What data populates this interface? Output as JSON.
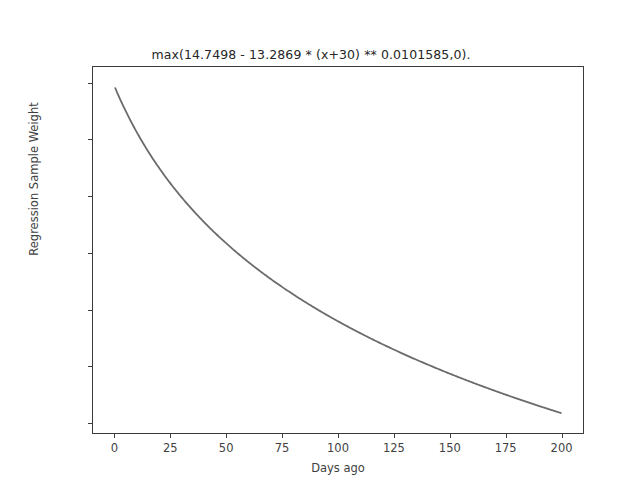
{
  "chart_data": {
    "type": "line",
    "title": "max(14.7498 - 13.2869 * (x+30) ** 0.0101585,0).\nReaches zero after 82 ~years.",
    "title_lines": [
      "max(14.7498 - 13.2869 * (x+30) ** 0.0101585,0).",
      "Reaches zero after 82 ~years."
    ],
    "xlabel": "Days ago",
    "ylabel": "Regression Sample Weight",
    "xlim": [
      -10,
      210
    ],
    "ylim": [
      0.6905,
      1.0145
    ],
    "xticks": [
      0,
      25,
      50,
      75,
      100,
      125,
      150,
      175,
      200
    ],
    "xtick_labels": [
      "0",
      "25",
      "50",
      "75",
      "100",
      "125",
      "150",
      "175",
      "200"
    ],
    "yticks": [
      0.7,
      0.75,
      0.8,
      0.85,
      0.9,
      0.95,
      1.0
    ],
    "ytick_labels": [
      "0.70",
      "0.75",
      "0.80",
      "0.85",
      "0.90",
      "0.95",
      "1.00"
    ],
    "grid": false,
    "legend": null,
    "line_color": "#6b6b6b",
    "line_width": 1.8,
    "formula": {
      "intercept": 14.7498,
      "coefficient": 13.2869,
      "offset": 30,
      "exponent": 0.0101585,
      "floor": 0
    },
    "x": [
      0,
      10,
      20,
      30,
      40,
      50,
      60,
      70,
      80,
      90,
      100,
      110,
      120,
      130,
      140,
      150,
      160,
      170,
      180,
      190,
      200
    ],
    "values": [
      0.9961,
      0.9532,
      0.9239,
      0.9013,
      0.8829,
      0.8673,
      0.8538,
      0.8418,
      0.8311,
      0.8214,
      0.8125,
      0.8043,
      0.7967,
      0.7896,
      0.783,
      0.7767,
      0.7708,
      0.7652,
      0.7598,
      0.7547,
      0.7499
    ],
    "series": [
      {
        "name": "Regression Sample Weight",
        "values": [
          0.9961,
          0.9532,
          0.9239,
          0.9013,
          0.8829,
          0.8673,
          0.8538,
          0.8418,
          0.8311,
          0.8214,
          0.8125,
          0.8043,
          0.7967,
          0.7896,
          0.783,
          0.7767,
          0.7708,
          0.7652,
          0.7598,
          0.7547,
          0.7499
        ]
      }
    ],
    "curve_start": {
      "x": 0,
      "y": 0.996
    },
    "curve_end": {
      "x": 200,
      "y": 0.709
    },
    "annotations": []
  }
}
